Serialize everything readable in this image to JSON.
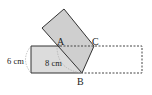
{
  "diagram": {
    "labels": {
      "A": "A",
      "B": "B",
      "C": "C",
      "height": "6 cm",
      "segment": "8 cm"
    },
    "colors": {
      "fill": "#d3d3d3",
      "stroke": "#333333",
      "dashed": "#444444",
      "arc": "#aaaaaa"
    }
  }
}
